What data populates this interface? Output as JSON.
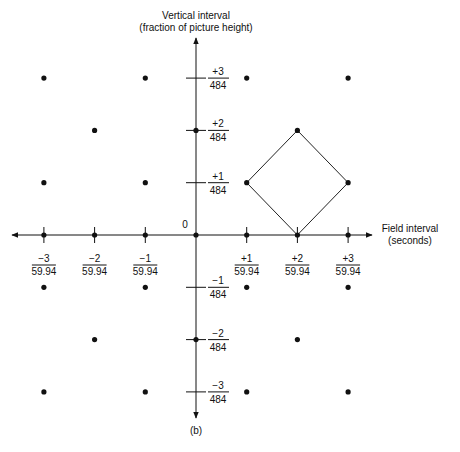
{
  "title": {
    "y_axis_line1": "Vertical interval",
    "y_axis_line2": "(fraction of picture height)",
    "x_axis_line1": "Field interval",
    "x_axis_line2": "(seconds)",
    "caption": "(b)",
    "origin": "0"
  },
  "x_ticks": [
    {
      "num": "−3",
      "den": "59.94"
    },
    {
      "num": "−2",
      "den": "59.94"
    },
    {
      "num": "−1",
      "den": "59.94"
    },
    {
      "num": "+1",
      "den": "59.94"
    },
    {
      "num": "+2",
      "den": "59.94"
    },
    {
      "num": "+3",
      "den": "59.94"
    }
  ],
  "y_ticks": [
    {
      "num": "+3",
      "den": "484"
    },
    {
      "num": "+2",
      "den": "484"
    },
    {
      "num": "+1",
      "den": "484"
    },
    {
      "num": "−1",
      "den": "484"
    },
    {
      "num": "−2",
      "den": "484"
    },
    {
      "num": "−3",
      "den": "484"
    }
  ],
  "lattice_points": [
    [
      -3,
      3
    ],
    [
      -1,
      3
    ],
    [
      1,
      3
    ],
    [
      3,
      3
    ],
    [
      -2,
      2
    ],
    [
      0,
      2
    ],
    [
      2,
      2
    ],
    [
      -3,
      1
    ],
    [
      -1,
      1
    ],
    [
      1,
      1
    ],
    [
      3,
      1
    ],
    [
      -3,
      0
    ],
    [
      -2,
      0
    ],
    [
      -1,
      0
    ],
    [
      0,
      0
    ],
    [
      1,
      0
    ],
    [
      2,
      0
    ],
    [
      3,
      0
    ],
    [
      -3,
      -1
    ],
    [
      -1,
      -1
    ],
    [
      1,
      -1
    ],
    [
      3,
      -1
    ],
    [
      -2,
      -2
    ],
    [
      0,
      -2
    ],
    [
      2,
      -2
    ],
    [
      -3,
      -3
    ],
    [
      -1,
      -3
    ],
    [
      1,
      -3
    ],
    [
      3,
      -3
    ]
  ],
  "diamond": [
    [
      2,
      2
    ],
    [
      3,
      1
    ],
    [
      2,
      0
    ],
    [
      1,
      1
    ]
  ]
}
